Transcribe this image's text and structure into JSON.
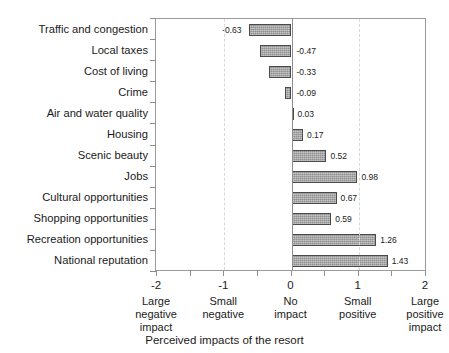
{
  "chart_data": {
    "type": "bar",
    "orientation": "horizontal",
    "title": "",
    "xlabel": "Perceived impacts of the resort",
    "ylabel": "",
    "xlim": [
      -2,
      2
    ],
    "grid": true,
    "legend": null,
    "categories": [
      "Traffic and congestion",
      "Local taxes",
      "Cost of living",
      "Crime",
      "Air and water quality",
      "Housing",
      "Scenic beauty",
      "Jobs",
      "Cultural opportunities",
      "Shopping opportunities",
      "Recreation opportunities",
      "National reputation"
    ],
    "values": [
      -0.63,
      -0.47,
      -0.33,
      -0.09,
      0.03,
      0.17,
      0.52,
      0.98,
      0.67,
      0.59,
      1.26,
      1.43
    ],
    "value_labels": [
      "-0.63",
      "-0.47",
      "-0.33",
      "-0.09",
      "0.03",
      "0.17",
      "0.52",
      "0.98",
      "0.67",
      "0.59",
      "1.26",
      "1.43"
    ],
    "xticks": [
      -2,
      -1.5,
      -1,
      -0.5,
      0,
      0.5,
      1,
      1.5,
      2
    ],
    "xtick_major": [
      {
        "value": -2,
        "number": "-2",
        "desc": [
          "Large",
          "negative",
          "impact"
        ]
      },
      {
        "value": -1,
        "number": "-1",
        "desc": [
          "Small",
          "negative"
        ]
      },
      {
        "value": 0,
        "number": "0",
        "desc": [
          "No",
          "impact"
        ]
      },
      {
        "value": 1,
        "number": "1",
        "desc": [
          "Small",
          "positive"
        ]
      },
      {
        "value": 2,
        "number": "2",
        "desc": [
          "Large",
          "positive",
          "impact"
        ]
      }
    ],
    "gridline_values": [
      -1,
      1
    ],
    "colors": {
      "bar_fill": "#8f8f8f",
      "bar_border": "#4a4a4a",
      "axis": "#8d8d8d",
      "grid": "#d8d8d8",
      "text": "#1a1a1a",
      "background": "#ffffff"
    }
  }
}
